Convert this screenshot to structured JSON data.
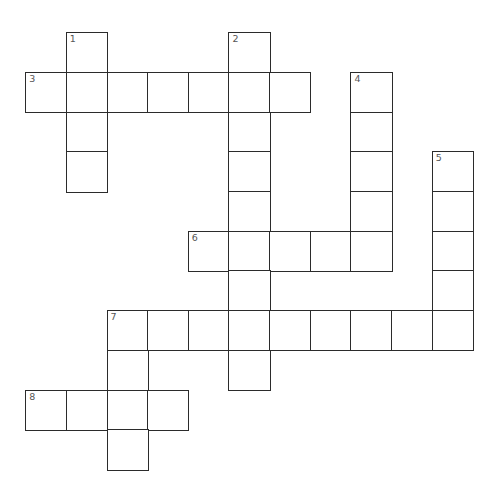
{
  "puzzle": {
    "type": "crossword",
    "grid": {
      "origin_x": 26,
      "origin_y": 33,
      "cell_w": 40.65,
      "cell_h": 39.7,
      "line_color": "#2b2b2b",
      "number_color": "#555555",
      "background": "#ffffff"
    },
    "cells": [
      {
        "r": 0,
        "c": 1,
        "num": "1"
      },
      {
        "r": 0,
        "c": 5,
        "num": "2"
      },
      {
        "r": 1,
        "c": 0,
        "num": "3"
      },
      {
        "r": 1,
        "c": 1
      },
      {
        "r": 1,
        "c": 2
      },
      {
        "r": 1,
        "c": 3
      },
      {
        "r": 1,
        "c": 4
      },
      {
        "r": 1,
        "c": 5
      },
      {
        "r": 1,
        "c": 6
      },
      {
        "r": 1,
        "c": 8,
        "num": "4"
      },
      {
        "r": 2,
        "c": 1
      },
      {
        "r": 2,
        "c": 5
      },
      {
        "r": 2,
        "c": 8
      },
      {
        "r": 3,
        "c": 1
      },
      {
        "r": 3,
        "c": 5
      },
      {
        "r": 3,
        "c": 8
      },
      {
        "r": 3,
        "c": 10,
        "num": "5"
      },
      {
        "r": 4,
        "c": 5
      },
      {
        "r": 4,
        "c": 8
      },
      {
        "r": 4,
        "c": 10
      },
      {
        "r": 5,
        "c": 4,
        "num": "6"
      },
      {
        "r": 5,
        "c": 5
      },
      {
        "r": 5,
        "c": 6
      },
      {
        "r": 5,
        "c": 7
      },
      {
        "r": 5,
        "c": 8
      },
      {
        "r": 5,
        "c": 10
      },
      {
        "r": 6,
        "c": 5
      },
      {
        "r": 6,
        "c": 10
      },
      {
        "r": 7,
        "c": 2,
        "num": "7"
      },
      {
        "r": 7,
        "c": 3
      },
      {
        "r": 7,
        "c": 4
      },
      {
        "r": 7,
        "c": 5
      },
      {
        "r": 7,
        "c": 6
      },
      {
        "r": 7,
        "c": 7
      },
      {
        "r": 7,
        "c": 8
      },
      {
        "r": 7,
        "c": 9
      },
      {
        "r": 7,
        "c": 10
      },
      {
        "r": 8,
        "c": 2
      },
      {
        "r": 8,
        "c": 5
      },
      {
        "r": 9,
        "c": 0,
        "num": "8"
      },
      {
        "r": 9,
        "c": 1
      },
      {
        "r": 9,
        "c": 2
      },
      {
        "r": 9,
        "c": 3
      },
      {
        "r": 10,
        "c": 2
      }
    ],
    "words": {
      "across": [
        {
          "number": "3",
          "row": 1,
          "col": 0,
          "length": 7
        },
        {
          "number": "6",
          "row": 5,
          "col": 4,
          "length": 5
        },
        {
          "number": "7",
          "row": 7,
          "col": 2,
          "length": 9
        },
        {
          "number": "8",
          "row": 9,
          "col": 0,
          "length": 4
        }
      ],
      "down": [
        {
          "number": "1",
          "row": 0,
          "col": 1,
          "length": 4
        },
        {
          "number": "2",
          "row": 0,
          "col": 5,
          "length": 9
        },
        {
          "number": "4",
          "row": 1,
          "col": 8,
          "length": 5
        },
        {
          "number": "5",
          "row": 3,
          "col": 10,
          "length": 5
        },
        {
          "number": "7",
          "row": 7,
          "col": 2,
          "length": 4
        }
      ]
    }
  }
}
